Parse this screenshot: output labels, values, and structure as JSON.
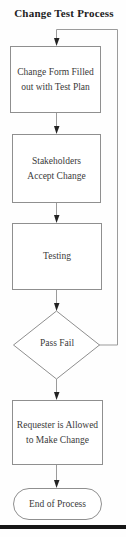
{
  "title": "Change Test Process",
  "nodes": [
    {
      "id": "change-form",
      "type": "process",
      "label": "Change Form Filled out with Test Plan"
    },
    {
      "id": "stakeholders",
      "type": "process",
      "label": "Stakeholders Accept Change"
    },
    {
      "id": "testing",
      "type": "process",
      "label": "Testing"
    },
    {
      "id": "pass-fail",
      "type": "decision",
      "label": "Pass Fail"
    },
    {
      "id": "requester",
      "type": "process",
      "label": "Requester is Allowed to Make Change"
    },
    {
      "id": "end",
      "type": "terminator",
      "label": "End of Process"
    }
  ],
  "edges": [
    {
      "from": "start",
      "to": "change-form"
    },
    {
      "from": "change-form",
      "to": "stakeholders"
    },
    {
      "from": "stakeholders",
      "to": "testing"
    },
    {
      "from": "testing",
      "to": "pass-fail"
    },
    {
      "from": "pass-fail",
      "to": "change-form",
      "kind": "feedback-loop"
    },
    {
      "from": "pass-fail",
      "to": "requester"
    },
    {
      "from": "requester",
      "to": "end"
    }
  ],
  "colors": {
    "connector_line": "#9b9b9b",
    "node_border": "#8f8f8f",
    "arrowhead": "#222222",
    "text": "#3a3a3a",
    "title_text": "#222222",
    "page_edge": "#161616"
  }
}
